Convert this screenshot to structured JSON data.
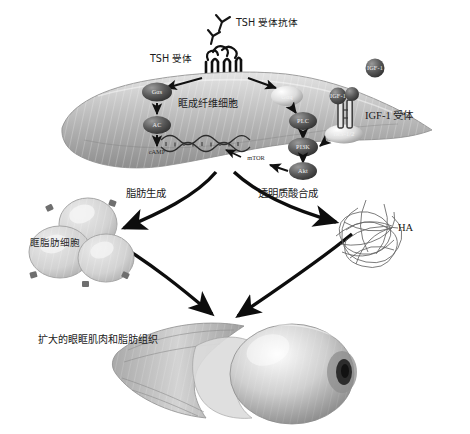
{
  "figure": {
    "type": "biomedical-pathway-diagram",
    "palette": {
      "background": "#ffffff",
      "ink": "#1a1a1a",
      "cell_fill_light": "#d8d8d8",
      "cell_fill_mid": "#a8a8a8",
      "cell_fill_dark": "#707070",
      "node_dark": "#4a4a4a",
      "node_light": "#e2e2e2",
      "arrow": "#111111"
    }
  },
  "top": {
    "antibody_label": "TSH 受体抗体",
    "antibody_icon": "antibody-y-icon",
    "receptor_label": "TSH 受体",
    "receptor_icon": "seven-transmembrane-receptor-icon"
  },
  "cell": {
    "name_label": "眶成纤维细胞",
    "dna_icon": "dna-double-helix-icon"
  },
  "pathway_camp": {
    "nodes": [
      {
        "id": "gas",
        "label": "Gαs",
        "tone": "dark"
      },
      {
        "id": "ac",
        "label": "AC",
        "tone": "dark"
      },
      {
        "id": "camp",
        "label": "cAMP",
        "tone": "text"
      }
    ]
  },
  "pathway_pi3k": {
    "nodes": [
      {
        "id": "gaq",
        "label": "Gαq",
        "tone": "light"
      },
      {
        "id": "plc",
        "label": "PLC",
        "tone": "dark"
      },
      {
        "id": "pi3k",
        "label": "PI3K",
        "tone": "dark"
      },
      {
        "id": "akt",
        "label": "Akt",
        "tone": "dark"
      },
      {
        "id": "mtor",
        "label": "mTOR",
        "tone": "text"
      },
      {
        "id": "irs",
        "label": "IRS-1/2",
        "tone": "light"
      }
    ]
  },
  "igf": {
    "receptor_label": "IGF-1 受体",
    "ligand_label": "IGF-1",
    "bound_ligand_label": "IGF-1",
    "receptor_icon": "igf1-receptor-icon"
  },
  "outcomes": {
    "left_label": "脂肪生成",
    "right_label": "透明质酸合成",
    "adipocyte_label": "眶脂肪细胞",
    "ha_label": "HA",
    "eye_label": "扩大的眼眶肌肉和脂肪组织"
  }
}
